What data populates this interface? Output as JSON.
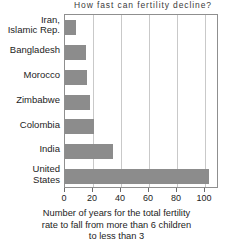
{
  "chart_data": {
    "type": "bar",
    "orientation": "horizontal",
    "title": "How fast can fertility decline?",
    "xlabel_lines": [
      "Number of years for the total fertility",
      "rate to fall from more than 6 children",
      "to less than 3"
    ],
    "ylabel": "",
    "categories": [
      "Iran,\nIslamic Rep.",
      "Bangladesh",
      "Morocco",
      "Zimbabwe",
      "Colombia",
      "India",
      "United\nStates"
    ],
    "category_lines": [
      [
        "Iran,",
        "Islamic Rep."
      ],
      [
        "Bangladesh"
      ],
      [
        "Morocco"
      ],
      [
        "Zimbabwe"
      ],
      [
        "Colombia"
      ],
      [
        "India"
      ],
      [
        "United",
        "States"
      ]
    ],
    "values": [
      8,
      15,
      16,
      18,
      21,
      34,
      103
    ],
    "xlim": [
      0,
      110
    ],
    "xticks": [
      0,
      20,
      40,
      60,
      80,
      100
    ],
    "xtick_labels": [
      "0",
      "20",
      "40",
      "60",
      "80",
      "100"
    ],
    "grid": true,
    "legend": null,
    "bar_color": "#8c8c8c",
    "frame_color": "#8f8f8f",
    "grid_color": "#c9c9c9",
    "background": "#ffffff"
  }
}
